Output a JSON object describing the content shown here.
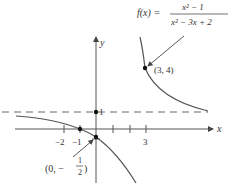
{
  "figure": {
    "function_label": {
      "lhs": "f(x) =",
      "numerator": "x² − 1",
      "denominator": "x² − 3x + 2"
    },
    "axes": {
      "x_label": "x",
      "y_label": "y",
      "x_ticks": [
        "−2",
        "−1",
        "3"
      ],
      "y_tick": "1"
    },
    "points": [
      {
        "label": "(3, 4)",
        "x": 3,
        "y": 4
      },
      {
        "label_prefix": "(0, −",
        "numer": "1",
        "denom": "2",
        "label_suffix": ")",
        "x": 0,
        "y": -0.5
      }
    ],
    "asymptotes": {
      "horizontal": "y = 1"
    },
    "colors": {
      "curve": "#555555",
      "axis": "#555555",
      "text": "#333333"
    }
  }
}
